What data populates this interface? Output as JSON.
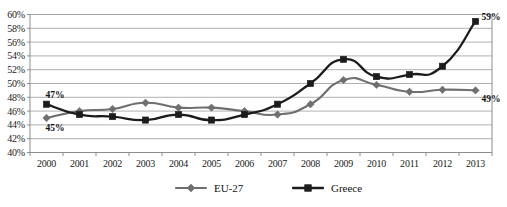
{
  "chart_data": {
    "type": "line",
    "title": "",
    "subtitle": "",
    "xlabel": "",
    "ylabel": "",
    "categories": [
      "2000",
      "2001",
      "2002",
      "2003",
      "2004",
      "2005",
      "2006",
      "2007",
      "2008",
      "2009",
      "2010",
      "2011",
      "2012",
      "2013"
    ],
    "ylim": [
      40,
      60
    ],
    "ytick_step": 2,
    "ytick_labels": [
      "40%",
      "42%",
      "44%",
      "46%",
      "48%",
      "50%",
      "52%",
      "54%",
      "56%",
      "58%",
      "60%"
    ],
    "ytick_values": [
      40,
      42,
      44,
      46,
      48,
      50,
      52,
      54,
      56,
      58,
      60
    ],
    "grid": true,
    "legend_position": "bottom",
    "value_suffix": "%",
    "series": [
      {
        "name": "EU-27",
        "color": "#6f6f6f",
        "marker": "diamond",
        "values": [
          45.0,
          46.0,
          46.3,
          47.2,
          46.5,
          46.5,
          46.0,
          45.5,
          47.0,
          50.5,
          49.8,
          48.8,
          49.1,
          49.0
        ]
      },
      {
        "name": "Greece",
        "color": "#1c1c1c",
        "marker": "square",
        "values": [
          47.0,
          45.5,
          45.2,
          44.7,
          45.5,
          44.7,
          45.5,
          47.0,
          50.0,
          53.5,
          51.0,
          51.3,
          52.5,
          59.0
        ]
      }
    ],
    "annotations": [
      {
        "text": "47%",
        "series": "Greece",
        "category": "2000",
        "position": "above-left"
      },
      {
        "text": "45%",
        "series": "EU-27",
        "category": "2000",
        "position": "below-left"
      },
      {
        "text": "59%",
        "series": "Greece",
        "category": "2013",
        "position": "above-right"
      },
      {
        "text": "49%",
        "series": "EU-27",
        "category": "2013",
        "position": "below-right"
      }
    ]
  },
  "legend": {
    "items": [
      {
        "label": "EU-27"
      },
      {
        "label": "Greece"
      }
    ]
  },
  "caption": {
    "text": ""
  }
}
